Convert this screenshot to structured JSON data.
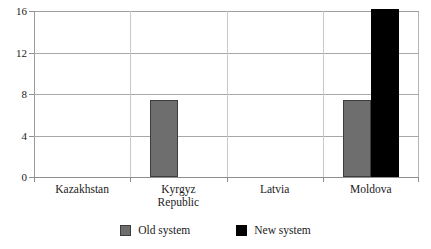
{
  "chart_data": {
    "type": "bar",
    "title": "",
    "xlabel": "",
    "ylabel": "",
    "ylim": [
      0,
      16
    ],
    "yticks": [
      0,
      4,
      8,
      12,
      16
    ],
    "ytick_labels": [
      "0",
      "4",
      "8",
      "12",
      "16"
    ],
    "grid": true,
    "legend_position": "bottom",
    "categories": [
      "Kazakhstan",
      "Kyrgyz Republic",
      "Latvia",
      "Moldova"
    ],
    "category_label_lines": [
      [
        "Kazakhstan"
      ],
      [
        "Kyrgyz",
        "Republic"
      ],
      [
        "Latvia"
      ],
      [
        "Moldova"
      ]
    ],
    "series": [
      {
        "name": "Old system",
        "color": "#6e6e6e",
        "values": [
          0,
          7.4,
          0,
          7.4
        ]
      },
      {
        "name": "New system",
        "color": "#000000",
        "values": [
          0,
          0,
          0,
          16.3
        ]
      }
    ]
  },
  "legend": {
    "items": [
      {
        "label": "Old system",
        "swatch": "old"
      },
      {
        "label": "New system",
        "swatch": "new"
      }
    ]
  },
  "colors": {
    "old_system": "#6e6e6e",
    "new_system": "#000000",
    "gridline": "#a8a8a8",
    "axis": "#8f8f8f",
    "background": "#ffffff"
  }
}
